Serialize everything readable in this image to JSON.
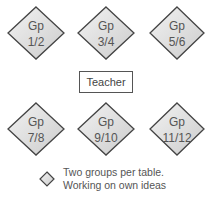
{
  "groups": [
    {
      "line1": "Gp",
      "line2": "1/2"
    },
    {
      "line1": "Gp",
      "line2": "3/4"
    },
    {
      "line1": "Gp",
      "line2": "5/6"
    },
    {
      "line1": "Gp",
      "line2": "7/8"
    },
    {
      "line1": "Gp",
      "line2": "9/10"
    },
    {
      "line1": "Gp",
      "line2": "11/12"
    }
  ],
  "teacher": {
    "label": "Teacher"
  },
  "legend": {
    "icon": "diamond-table-icon",
    "line1": "Two groups per table.",
    "line2": "Working on own ideas"
  },
  "colors": {
    "diamond_fill_light": "#efefef",
    "diamond_fill_dark": "#cfcfcf",
    "diamond_stroke": "#444444",
    "text": "#555555"
  }
}
